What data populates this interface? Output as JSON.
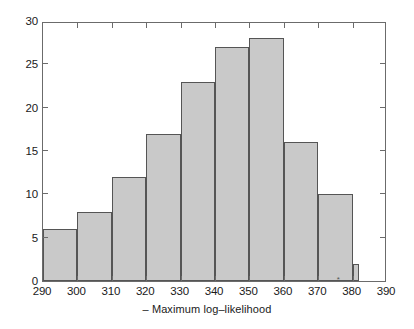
{
  "chart_data": {
    "type": "bar",
    "title": "",
    "subtitle": "",
    "xlabel": "– Maximum log–likelihood",
    "ylabel": "",
    "xlim": [
      290,
      390
    ],
    "ylim": [
      0,
      30
    ],
    "grid": false,
    "legend": null,
    "bin_width": 10,
    "categories": [
      "290–300",
      "300–310",
      "310–320",
      "320–330",
      "330–340",
      "340–350",
      "350–360",
      "360–370",
      "370–380",
      "380–382"
    ],
    "bin_edges": [
      290,
      300,
      310,
      320,
      330,
      340,
      350,
      360,
      370,
      380,
      382
    ],
    "values": [
      6,
      8,
      12,
      17,
      23,
      27,
      28,
      16,
      10,
      2
    ],
    "xticks": [
      290,
      300,
      310,
      320,
      330,
      340,
      350,
      360,
      370,
      380,
      390
    ],
    "xticklabels": [
      "290",
      "300",
      "310",
      "320",
      "330",
      "340",
      "350",
      "360",
      "370",
      "380",
      "390"
    ],
    "yticks": [
      0,
      5,
      10,
      15,
      20,
      25,
      30
    ],
    "yticklabels": [
      "0",
      "5",
      "10",
      "15",
      "20",
      "25",
      "30"
    ],
    "annotations": [
      {
        "name": "asterisk-marker",
        "text": "*",
        "x": 376,
        "y": 0
      }
    ],
    "colors": {
      "bar_fill": "#c9c9c9",
      "bar_edge": "#555555",
      "axis": "#6b6b6b",
      "text": "#1a1a1a",
      "background": "#ffffff"
    }
  }
}
